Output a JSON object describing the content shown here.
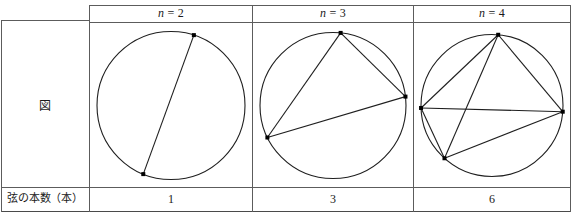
{
  "table": {
    "corner_cell_label": "",
    "row_headers": [
      {
        "id": "figure-row",
        "label": "図"
      },
      {
        "id": "chord-count-row",
        "label": "弦の本数（本）"
      }
    ],
    "column_headers": [
      {
        "id": "n-2",
        "label": "n = 2",
        "var": "n",
        "eq": "= 2"
      },
      {
        "id": "n-3",
        "label": "n = 3",
        "var": "n",
        "eq": "= 3"
      },
      {
        "id": "n-4",
        "label": "n = 4",
        "var": "n",
        "eq": "= 4"
      }
    ],
    "chord_counts": [
      "1",
      "3",
      "6"
    ]
  },
  "figures": [
    {
      "id": "circle-n2",
      "n": 2,
      "chord_count": 1,
      "points_deg": [
        72,
        248
      ],
      "chords": [
        [
          0,
          1
        ]
      ]
    },
    {
      "id": "circle-n3",
      "n": 3,
      "chord_count": 3,
      "points_deg": [
        84,
        7,
        206
      ],
      "chords": [
        [
          0,
          1
        ],
        [
          1,
          2
        ],
        [
          2,
          0
        ]
      ]
    },
    {
      "id": "circle-n4",
      "n": 4,
      "chord_count": 6,
      "points_deg": [
        85,
        355,
        228,
        182
      ],
      "chords": [
        [
          0,
          1
        ],
        [
          0,
          2
        ],
        [
          0,
          3
        ],
        [
          1,
          2
        ],
        [
          1,
          3
        ],
        [
          2,
          3
        ]
      ]
    }
  ],
  "style": {
    "border_color": "#5c5c5c",
    "ink_color": "#1f1f1f",
    "background": "#ffffff"
  }
}
